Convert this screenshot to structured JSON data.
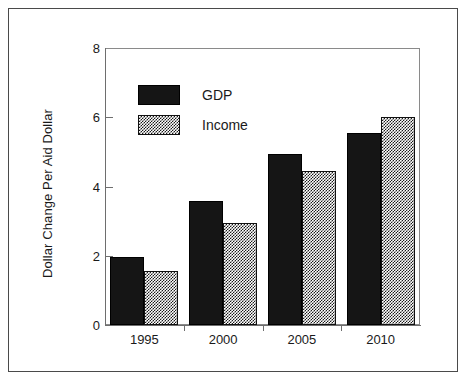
{
  "chart_data": {
    "type": "bar",
    "title": "",
    "subtitle": "",
    "xlabel": "",
    "ylabel": "Dollar Change Per Aid Dollar",
    "categories": [
      "1995",
      "2000",
      "2005",
      "2010"
    ],
    "series": [
      {
        "name": "GDP",
        "values": [
          1.95,
          3.58,
          4.95,
          5.55
        ],
        "color": "#151515",
        "fill": "solid"
      },
      {
        "name": "Income",
        "values": [
          1.55,
          2.95,
          4.45,
          6.0
        ],
        "color": "#808080",
        "fill": "checkered"
      }
    ],
    "ylim": [
      0,
      8
    ],
    "y_ticks": [
      "0",
      "2",
      "4",
      "6",
      "8"
    ],
    "y_tick_values": [
      0,
      2,
      4,
      6,
      8
    ],
    "grid": false,
    "legend_position": "inside-upper-left",
    "legend_entries": [
      "GDP",
      "Income"
    ],
    "annotations": [],
    "frame": true
  }
}
